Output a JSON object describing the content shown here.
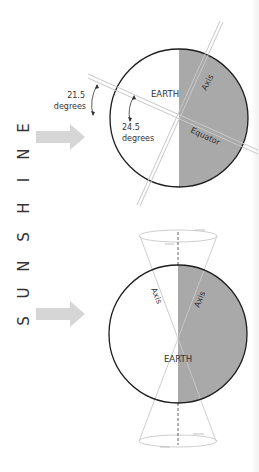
{
  "figure": {
    "side_label": "S U N S H I N E",
    "side_letters": [
      "S",
      "U",
      "N",
      "S",
      "H",
      "I",
      "N",
      "E"
    ],
    "colors": {
      "shade": "#a9a9a9",
      "outline": "#1e1e1e",
      "arrow": "#d6d6d6",
      "axis_line": "#c8c8c8",
      "dashed_axis": "#555555",
      "text": "#333333"
    }
  },
  "top_diagram": {
    "earth_label": "EARTH",
    "axis_label": "Axis",
    "equator_label": "Equator",
    "angle_outer": {
      "value": "21.5",
      "unit": "degrees"
    },
    "angle_inner": {
      "value": "24.5",
      "unit": "degrees"
    }
  },
  "bottom_diagram": {
    "earth_label": "EARTH",
    "axis_label_left": "Axis",
    "axis_label_right": "Axis"
  }
}
